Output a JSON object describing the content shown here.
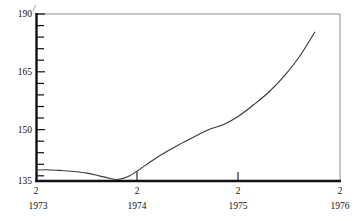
{
  "chart_data": {
    "type": "line",
    "title": "",
    "subtitle": "",
    "xlabel": "",
    "ylabel": "",
    "ylim": [
      135,
      190
    ],
    "xlim": [
      1973.0,
      1976.0
    ],
    "grid": false,
    "legend": null,
    "y_ticks_major": [
      135,
      150,
      165,
      190
    ],
    "y_ticks_major_labels": [
      "135",
      "150",
      "165",
      "190"
    ],
    "y_minor_tick_step": 5,
    "x_tick_labels": [
      "2",
      "2",
      "2",
      "2"
    ],
    "x_year_labels": [
      "1973",
      "1974",
      "1975",
      "1976"
    ],
    "x_tick_positions": [
      1973.0,
      1974.0,
      1975.0,
      1976.0
    ],
    "axis_top_mark": "/",
    "series": [
      {
        "name": "index",
        "x": [
          1973.0,
          1973.1,
          1973.22,
          1973.35,
          1973.5,
          1973.62,
          1973.72,
          1973.8,
          1973.9,
          1974.0,
          1974.12,
          1974.25,
          1974.4,
          1974.55,
          1974.7,
          1974.85,
          1975.0,
          1975.15,
          1975.3,
          1975.45,
          1975.6,
          1975.75
        ],
        "values": [
          138.6,
          138.7,
          138.5,
          138.2,
          137.6,
          136.7,
          135.9,
          135.5,
          136.4,
          138.4,
          141.2,
          144.0,
          146.8,
          149.4,
          151.9,
          153.6,
          156.4,
          160.2,
          164.4,
          169.6,
          176.0,
          184.0
        ]
      }
    ]
  },
  "footer": {
    "smudge_text": ""
  }
}
